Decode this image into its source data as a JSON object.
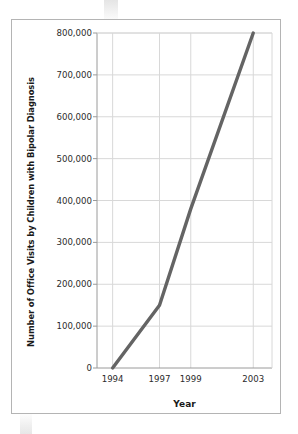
{
  "chart_data": {
    "type": "line",
    "title": "",
    "xlabel": "Year",
    "ylabel": "Number of Office Visits by Children with Bipolar Diagnosis",
    "x": [
      1994,
      1997,
      1999,
      2003
    ],
    "values": [
      0,
      150000,
      380000,
      800000
    ],
    "series": [
      {
        "name": "Office visits",
        "values": [
          0,
          150000,
          380000,
          800000
        ]
      }
    ],
    "xticks": [
      "1994",
      "1997",
      "1999",
      "2003"
    ],
    "yticks": [
      "0",
      "100,000",
      "200,000",
      "300,000",
      "400,000",
      "500,000",
      "600,000",
      "700,000",
      "800,000"
    ],
    "ytick_values": [
      0,
      100000,
      200000,
      300000,
      400000,
      500000,
      600000,
      700000,
      800000
    ],
    "ylim": [
      0,
      800000
    ],
    "xlim": [
      1993,
      2004.2
    ],
    "grid": true,
    "legend": "none",
    "line_color": "#646464",
    "grid_color": "#d8d8d8",
    "axis_color": "#9a9a9a",
    "frame_color": "#b4b4b4",
    "background": "#ffffff"
  },
  "figure": {
    "y_axis_title": "Number of Office Visits by Children with Bipolar Diagnosis",
    "x_axis_title": "Year"
  }
}
